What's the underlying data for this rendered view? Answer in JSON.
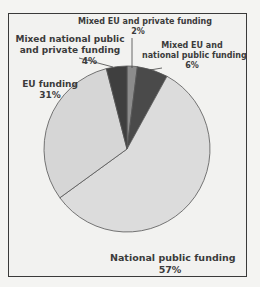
{
  "chart_data": {
    "type": "pie",
    "title": "",
    "categories": [
      "Mixed EU and private funding",
      "Mixed EU and national public funding",
      "National public funding",
      "EU funding",
      "Mixed national public and private funding"
    ],
    "values": [
      2,
      6,
      57,
      31,
      4
    ],
    "colors": [
      "#8c8c8c",
      "#4a4a4a",
      "#dcdcdc",
      "#d6d6d6",
      "#3f3f3f"
    ],
    "labels": [
      {
        "name": "Mixed EU and private funding",
        "pct": "2%"
      },
      {
        "name": "Mixed EU and national public funding",
        "pct": "6%"
      },
      {
        "name": "National public funding",
        "pct": "57%"
      },
      {
        "name": "EU funding",
        "pct": "31%"
      },
      {
        "name": "Mixed national public and private funding",
        "pct": "4%"
      }
    ],
    "start_angle": "top, clockwise",
    "legend": "none (direct labels)"
  },
  "labels": {
    "eu_private": {
      "line1": "Mixed EU and private funding",
      "pct": "2%"
    },
    "eu_national": {
      "line1": "Mixed EU and",
      "line2": "national public funding",
      "pct": "6%"
    },
    "national": {
      "line1": "National public funding",
      "pct": "57%"
    },
    "eu": {
      "line1": "EU funding",
      "pct": "31%"
    },
    "national_private": {
      "line1": "Mixed national public",
      "line2": "and private funding",
      "pct": "4%"
    }
  }
}
